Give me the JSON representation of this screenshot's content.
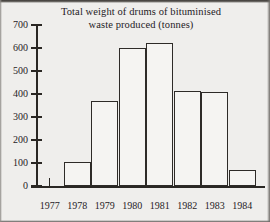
{
  "chart_data": {
    "type": "bar",
    "title": "Total weight of drums of bituminised waste produced (tonnes)",
    "title_lines": [
      "Total weight of drums of bituminised",
      "waste produced (tonnes)"
    ],
    "xlabel": "",
    "ylabel": "",
    "categories": [
      "1977",
      "1978",
      "1979",
      "1980",
      "1981",
      "1982",
      "1983",
      "1984"
    ],
    "values": [
      0,
      105,
      370,
      600,
      620,
      415,
      410,
      70
    ],
    "ylim": [
      0,
      700
    ],
    "yticks": [
      0,
      100,
      200,
      300,
      400,
      500,
      600,
      700
    ],
    "ytick_labels": [
      "0",
      "100",
      "200",
      "300",
      "400",
      "500",
      "600",
      "700"
    ],
    "grid": false,
    "legend": null,
    "bar_facecolor": "#f5f4f2",
    "bar_edgecolor": "#2e2b28",
    "axis_color": "#2a2724",
    "background": "#efeeec"
  }
}
